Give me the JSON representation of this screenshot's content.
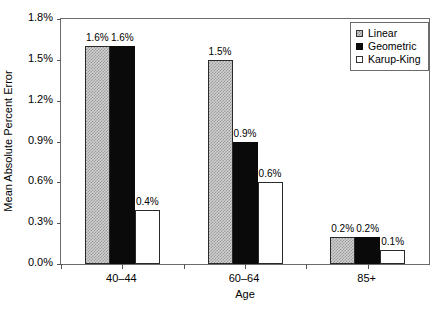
{
  "chart_data": {
    "type": "bar",
    "title": "",
    "xlabel": "Age",
    "ylabel": "Mean Absolute Percent Error",
    "categories": [
      "40–44",
      "60–64",
      "85+"
    ],
    "series": [
      {
        "name": "Linear",
        "values": [
          1.6,
          1.5,
          0.2
        ],
        "labels": [
          "1.6%",
          "1.5%",
          "0.2%"
        ],
        "style": "series-linear"
      },
      {
        "name": "Geometric",
        "values": [
          1.6,
          0.9,
          0.2
        ],
        "labels": [
          "1.6%",
          "0.9%",
          "0.2%"
        ],
        "style": "series-geometric"
      },
      {
        "name": "Karup-King",
        "values": [
          0.4,
          0.6,
          0.1
        ],
        "labels": [
          "0.4%",
          "0.6%",
          "0.1%"
        ],
        "style": "series-karupking"
      }
    ],
    "ylim": [
      0,
      1.8
    ],
    "ytick_values": [
      0.0,
      0.3,
      0.6,
      0.9,
      1.2,
      1.5,
      1.8
    ],
    "ytick_labels": [
      "0.0%",
      "0.3%",
      "0.6%",
      "0.9%",
      "1.2%",
      "1.5%",
      "1.8%"
    ],
    "grid": false,
    "legend_position": "top-right",
    "value_labels_shown": true,
    "colors": {
      "linear": "#d0d0d0",
      "geometric": "#0a0a0a",
      "karup_king": "#ffffff",
      "frame": "#6b6b6b",
      "text": "#000000"
    }
  }
}
